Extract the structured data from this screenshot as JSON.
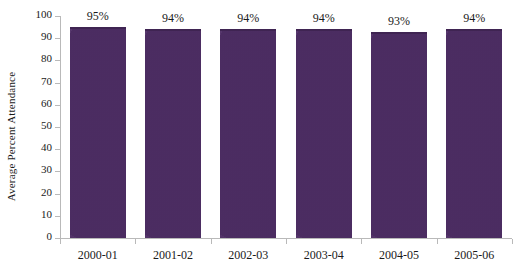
{
  "chart_data": {
    "type": "bar",
    "title": "",
    "subtitle": "",
    "xlabel": "",
    "ylabel": "Average Percent Attendance",
    "categories": [
      "2000-01",
      "2001-02",
      "2002-03",
      "2003-04",
      "2004-05",
      "2005-06"
    ],
    "values": [
      95,
      94,
      94,
      94,
      93,
      94
    ],
    "data_labels": [
      "95%",
      "94%",
      "94%",
      "94%",
      "93%",
      "94%"
    ],
    "series": [
      {
        "name": "Average Percent Attendance",
        "values": [
          95,
          94,
          94,
          94,
          93,
          94
        ]
      }
    ],
    "ylim": [
      0,
      100
    ],
    "ytick_values": [
      0,
      10,
      20,
      30,
      40,
      50,
      60,
      70,
      80,
      90,
      100
    ],
    "ytick_labels": [
      "0",
      "10",
      "20",
      "30",
      "40",
      "50",
      "60",
      "70",
      "80",
      "90",
      "100"
    ],
    "grid": false,
    "legend": false,
    "legend_position": "none",
    "bar_color": "#52306a",
    "bar_edge_color": "#3f2452",
    "axis_color": "#b9b9b9",
    "text_color": "#1a1a1a",
    "background_color": "#ffffff"
  }
}
